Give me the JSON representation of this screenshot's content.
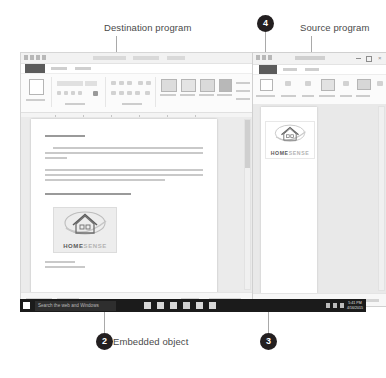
{
  "figure": {
    "callouts": [
      {
        "id": "destination-program",
        "label": "Destination program"
      },
      {
        "id": "source-program",
        "label": "Source program"
      },
      {
        "id": "embedded-object",
        "label": "Embedded object"
      }
    ],
    "markers": [
      {
        "id": "marker-2",
        "number": "2"
      },
      {
        "id": "marker-3",
        "number": "3"
      },
      {
        "id": "marker-4",
        "number": "4"
      }
    ],
    "marker_color": "#231f20",
    "leader_color": "#a9a9a9",
    "label_color": "#4a4a4a"
  },
  "destination_window": {
    "app": "Word",
    "document": {
      "salutation": "Dear Home Owner,",
      "paragraphs": [
        "Are you tired of digging through your mailbox to find your quotes? We have that problem under control and you need it done for them? Now it is time to organize Home Sense is happy to be able to help!",
        "Several options are available in the event of full-home organization. The good thing about organizing your kitchen is you can create usable space without investing a fortune. Kitchen organizers generally range in price from $40 to $60. So what are you waiting for?"
      ],
      "closing_line": "Check out these options and get busy!",
      "signature": [
        "Tim Topfl",
        "Home Owner, Inc."
      ]
    },
    "embedded_logo": {
      "brand_bold": "HOME",
      "brand_light": "SENSE"
    }
  },
  "source_window": {
    "app": "Excel",
    "logo": {
      "brand_bold": "HOME",
      "brand_light": "SENSE"
    }
  },
  "taskbar": {
    "search_placeholder": "Search the web and Windows",
    "start_icon": "windows-start-icon",
    "clock": {
      "time": "5:41 PM",
      "date": "4/16/2015"
    }
  }
}
